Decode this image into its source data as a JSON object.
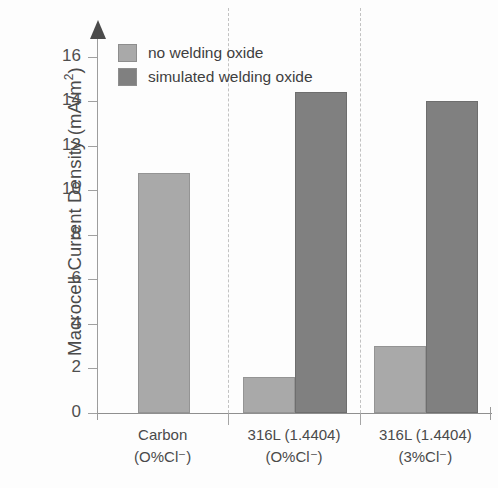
{
  "chart_data": {
    "type": "bar",
    "title": "",
    "xlabel": "",
    "ylabel": "Macrocell Current Density (mA/m",
    "ylabel_sup": "2",
    "ylabel_suffix": ")",
    "categories": [
      "Carbon\n(O%Cl⁻)",
      "316L (1.4404)\n(O%Cl⁻)",
      "316L (1.4404)\n(3%Cl⁻)"
    ],
    "category_lines": [
      {
        "line1": "Carbon",
        "line2": "(O%Cl⁻)"
      },
      {
        "line1": "316L (1.4404)",
        "line2": "(O%Cl⁻)"
      },
      {
        "line1": "316L (1.4404)",
        "line2": "(3%Cl⁻)"
      }
    ],
    "series": [
      {
        "name": "no welding oxide",
        "color": "#a9a9a9",
        "values": [
          10.8,
          1.6,
          3.0
        ]
      },
      {
        "name": "simulated welding oxide",
        "color": "#808080",
        "values": [
          null,
          14.4,
          14.0
        ]
      }
    ],
    "ylim": [
      0,
      17.2
    ],
    "yticks": [
      0,
      2,
      4,
      6,
      8,
      10,
      12,
      14,
      16
    ],
    "ytick_labels": [
      "0",
      "2",
      "4",
      "6",
      "8",
      "10",
      "12",
      "14",
      "16"
    ],
    "grid": false,
    "legend_position": "top-left",
    "group_separators": true,
    "axis_arrow": true
  },
  "legend": {
    "items": [
      {
        "label": "no welding oxide",
        "swatch": "light"
      },
      {
        "label": "simulated welding oxide",
        "swatch": "dark"
      }
    ]
  },
  "colors": {
    "light_gray": "#a9a9a9",
    "dark_gray": "#808080",
    "axis": "#9d9d9d",
    "text": "#4a4a4a",
    "separator": "#c2c2c2",
    "background": "#fdfdfd"
  }
}
